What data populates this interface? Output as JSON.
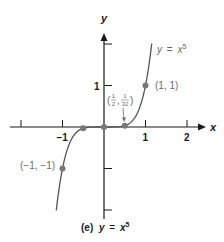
{
  "chart_data": {
    "type": "line",
    "caption": {
      "prefix": "(e)",
      "lhs": "y",
      "eq": "=",
      "base": "x",
      "exp": "5"
    },
    "xlabel": "x",
    "ylabel": "y",
    "xlim": [
      -2.5,
      2.5
    ],
    "ylim": [
      -2.2,
      2.2
    ],
    "x_ticks": [
      -2,
      -1,
      1,
      2
    ],
    "x_tick_labels": [
      "",
      "−1",
      "1",
      "2"
    ],
    "y_ticks": [
      -2,
      -1,
      1,
      2
    ],
    "y_tick_labels": [
      "",
      "",
      "1",
      ""
    ],
    "grid": false,
    "series": [
      {
        "name": "y = x^5",
        "function": "x^5",
        "x_range": [
          -1.15,
          1.15
        ]
      }
    ],
    "points": [
      {
        "x": -1,
        "y": -1,
        "label": "(−1, −1)"
      },
      {
        "x": -0.5,
        "y": -0.03125,
        "label": ""
      },
      {
        "x": 0,
        "y": 0,
        "label": ""
      },
      {
        "x": 0.5,
        "y": 0.03125,
        "label": "(1/2, 1/32)"
      },
      {
        "x": 1,
        "y": 1,
        "label": "(1, 1)"
      }
    ],
    "curve_label": {
      "lhs": "y",
      "eq": "=",
      "base": "x",
      "exp": "5"
    },
    "annotations": {
      "half_point": {
        "open": "(",
        "num1": "1",
        "den1": "2",
        "comma": ",",
        "num2": "1",
        "den2": "32",
        "close": ")"
      }
    }
  }
}
